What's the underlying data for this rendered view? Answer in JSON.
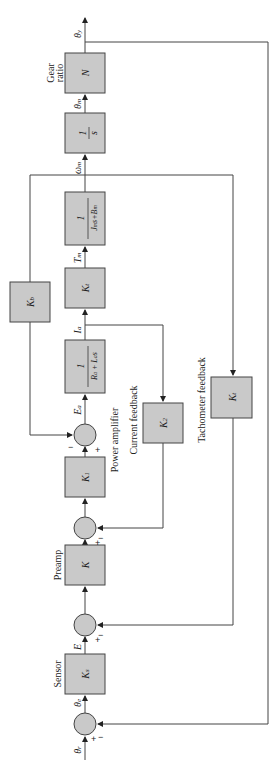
{
  "diagram": {
    "orientation": "rotated 90° counter-clockwise",
    "blocks": [
      {
        "id": "Ks",
        "label": "Ks",
        "caption": "Sensor"
      },
      {
        "id": "K",
        "label": "K",
        "caption": "Preamp"
      },
      {
        "id": "K1",
        "label": "K1",
        "caption": "Power amplifier"
      },
      {
        "id": "armature",
        "numerator": "1",
        "denominator": "Ra + La s"
      },
      {
        "id": "Kt_torque",
        "label": "Kt"
      },
      {
        "id": "mech",
        "numerator": "1",
        "denominator": "Jm s + Bm"
      },
      {
        "id": "integrator",
        "numerator": "1",
        "denominator": "s"
      },
      {
        "id": "N",
        "label": "N",
        "caption": "Gear ratio"
      },
      {
        "id": "Kb",
        "label": "Kb"
      },
      {
        "id": "K2",
        "label": "K2",
        "caption": "Current feedback"
      },
      {
        "id": "Kt_tach",
        "label": "Kt",
        "caption": "Tachometer feedback"
      }
    ],
    "signals": {
      "input": "θr",
      "error": "θe",
      "sensor_out": "E",
      "amp_out": "Ea",
      "current": "Ia",
      "torque": "Tm",
      "speed": "ωm",
      "motor_angle": "θm",
      "output": "θy"
    },
    "signs": {
      "plus": "+",
      "minus": "−"
    }
  }
}
